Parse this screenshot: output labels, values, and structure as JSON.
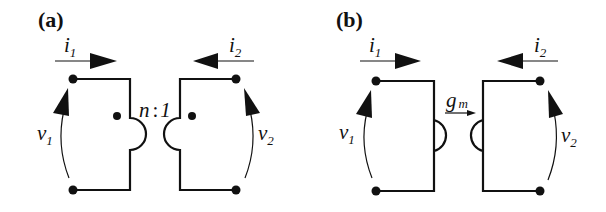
{
  "figure": {
    "panels": [
      {
        "id": "a",
        "label": "(a)",
        "element": "ideal transformer",
        "ratio_label": "n : 1",
        "ratio_n": "n",
        "ratio_sep": ":",
        "ratio_1": "1",
        "port1": {
          "current": "i",
          "current_sub": "1",
          "voltage": "v",
          "voltage_sub": "1"
        },
        "port2": {
          "current": "i",
          "current_sub": "2",
          "voltage": "v",
          "voltage_sub": "2"
        },
        "dot_markers": true
      },
      {
        "id": "b",
        "label": "(b)",
        "element": "gyrator",
        "gain_label": "g_m",
        "gain_symbol": "g",
        "gain_sub": "m",
        "port1": {
          "current": "i",
          "current_sub": "1",
          "voltage": "v",
          "voltage_sub": "1"
        },
        "port2": {
          "current": "i",
          "current_sub": "2",
          "voltage": "v",
          "voltage_sub": "2"
        },
        "dot_markers": false
      }
    ],
    "colors": {
      "ink": "#111111",
      "background": "#ffffff"
    }
  }
}
